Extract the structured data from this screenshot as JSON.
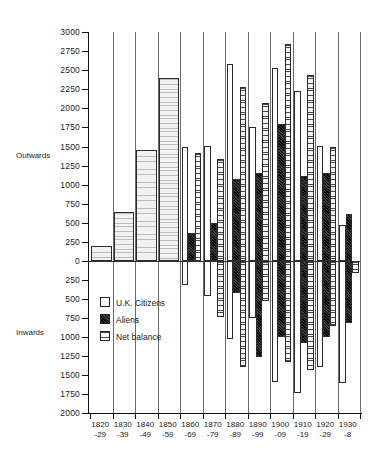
{
  "chart_data": {
    "type": "bar",
    "title": "",
    "xlabel": "",
    "ylabel": "",
    "grid": true,
    "legend_position": "inside-lower-left",
    "orientation": "vertical-diverging",
    "axis_top_label": "Outwards",
    "axis_bottom_label": "Inwards",
    "ylim": [
      -2000,
      3000
    ],
    "yticks": [
      3000,
      2750,
      2500,
      2250,
      2000,
      1750,
      1500,
      1250,
      1000,
      750,
      500,
      250,
      0,
      250,
      500,
      750,
      1000,
      1250,
      1500,
      1750,
      2000
    ],
    "ytick_labels": [
      "3000",
      "2750",
      "2500",
      "2250",
      "2000",
      "1750",
      "1500",
      "1250",
      "1000",
      "750",
      "500",
      "250",
      "0",
      "250",
      "500",
      "750",
      "1000",
      "1250",
      "1500",
      "1750",
      "2000"
    ],
    "categories": [
      "1820-29",
      "1830-39",
      "1840-49",
      "1850-59",
      "1860-69",
      "1870-79",
      "1880-89",
      "1890-99",
      "1900-09",
      "1910-19",
      "1920-29",
      "1930-8"
    ],
    "category_label_top": [
      "1820",
      "1830",
      "1840",
      "1850",
      "1860",
      "1870",
      "1880",
      "1890",
      "1900",
      "1910",
      "1920",
      "1930"
    ],
    "category_label_bottom": [
      "-29",
      "-39",
      "-49",
      "-59",
      "-69",
      "-79",
      "-89",
      "-99",
      "-09",
      "-19",
      "-29",
      "-8"
    ],
    "series": [
      {
        "name": "U.K. Citizens",
        "key": "uk",
        "values": [
          null,
          null,
          null,
          null,
          1500,
          1510,
          2580,
          1750,
          2530,
          2230,
          1510,
          470
        ]
      },
      {
        "name": "Aliens",
        "key": "alien",
        "values": [
          null,
          null,
          null,
          null,
          370,
          500,
          1080,
          1150,
          1800,
          1110,
          1150,
          610
        ]
      },
      {
        "name": "Net balance",
        "key": "net",
        "values": [
          200,
          640,
          1450,
          2400,
          1410,
          1340,
          2280,
          2070,
          2840,
          2440,
          1490,
          -160
        ]
      }
    ],
    "negative_series": [
      {
        "name": "U.K. Citizens inwards",
        "key": "uk",
        "values": [
          null,
          null,
          null,
          null,
          -320,
          -460,
          -1020,
          -750,
          -1590,
          -1740,
          -1390,
          -1600
        ]
      },
      {
        "name": "Aliens inwards",
        "key": "alien",
        "values": [
          null,
          null,
          null,
          null,
          0,
          0,
          -420,
          -1260,
          -1000,
          -1080,
          -1000,
          -820
        ]
      },
      {
        "name": "Net balance inwards",
        "key": "net",
        "values": [
          0,
          0,
          0,
          0,
          0,
          -740,
          -1400,
          -520,
          -1330,
          -1430,
          -860,
          0
        ]
      }
    ],
    "legend": [
      {
        "label": "U.K. Citizens",
        "key": "uk"
      },
      {
        "label": "Aliens",
        "key": "alien"
      },
      {
        "label": "Net balance",
        "key": "net"
      }
    ]
  }
}
